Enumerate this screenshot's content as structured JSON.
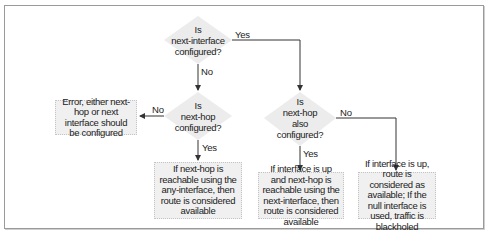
{
  "diagram": {
    "decisions": [
      {
        "id": "d1",
        "lines": [
          "Is",
          "next-interface",
          "configured?"
        ]
      },
      {
        "id": "d2",
        "lines": [
          "Is",
          "next-hop",
          "configured?"
        ]
      },
      {
        "id": "d3",
        "lines": [
          "Is",
          "next-hop",
          "also",
          "configured?"
        ]
      }
    ],
    "outcomes": [
      {
        "id": "error",
        "text": "Error, either next-hop or next interface should be configured"
      },
      {
        "id": "any_interface",
        "text": "If next-hop is reachable using the any-interface, then route is considered available"
      },
      {
        "id": "next_interface",
        "text": "If interface is up and next-hop is reachable using the next-interface, then route is considered available"
      },
      {
        "id": "null_interface",
        "text": "If interface is up, route is considered as available; If the null interface is used, traffic is blackholed"
      }
    ],
    "edge_labels": {
      "d1_yes": "Yes",
      "d1_no": "No",
      "d2_no": "No",
      "d2_yes": "Yes",
      "d3_no": "No",
      "d3_yes": "Yes"
    },
    "colors": {
      "diamond_fill": "#ececec",
      "box_fill": "#f0f0f0",
      "line": "#333333",
      "border": "#9a9a9a"
    }
  }
}
